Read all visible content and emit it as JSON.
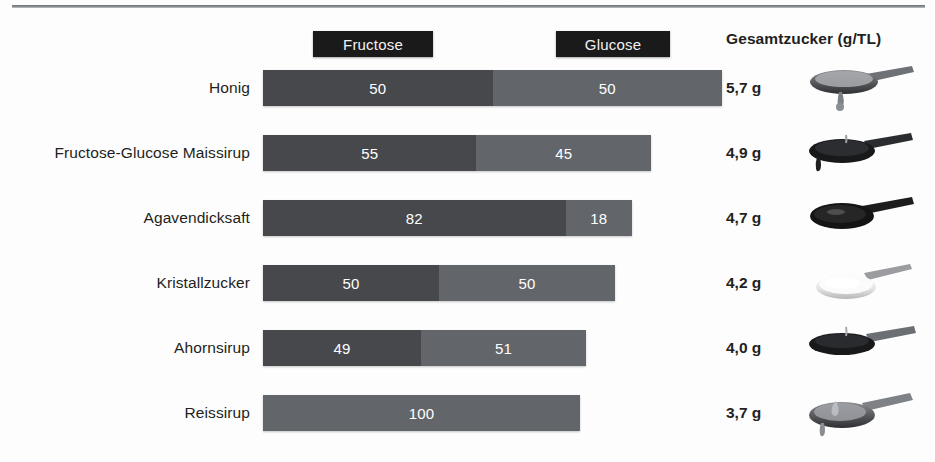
{
  "legend": {
    "fructose_label": "Fructose",
    "glucose_label": "Glucose"
  },
  "columns": {
    "total_sugar_header": "Gesamtzucker (g/TL)"
  },
  "colors": {
    "fructose": "#46484c",
    "glucose": "#626569",
    "legend_chip": "#1a1a1a",
    "text": "#231f20",
    "background": "#fdfdfd"
  },
  "rows": [
    {
      "label": "Honig",
      "fructose": "50",
      "glucose": "50",
      "total": "5,7 g",
      "image": "spoon-dripping-honey"
    },
    {
      "label": "Fructose-Glucose Maissirup",
      "fructose": "55",
      "glucose": "45",
      "total": "4,9 g",
      "image": "spoon-dark-corn-syrup"
    },
    {
      "label": "Agavendicksaft",
      "fructose": "82",
      "glucose": "18",
      "total": "4,7 g",
      "image": "spoon-dark-agave-syrup"
    },
    {
      "label": "Kristallzucker",
      "fructose": "50",
      "glucose": "50",
      "total": "4,2 g",
      "image": "spoon-white-crystal-sugar"
    },
    {
      "label": "Ahornsirup",
      "fructose": "49",
      "glucose": "51",
      "total": "4,0 g",
      "image": "spoon-maple-syrup"
    },
    {
      "label": "Reissirup",
      "fructose": "",
      "glucose": "100",
      "total": "3,7 g",
      "image": "spoon-rice-syrup"
    }
  ],
  "chart_data": {
    "type": "bar",
    "title": "",
    "subtype": "horizontal-stacked-100-percent",
    "categories": [
      "Honig",
      "Fructose-Glucose Maissirup",
      "Agavendicksaft",
      "Kristallzucker",
      "Ahornsirup",
      "Reissirup"
    ],
    "series": [
      {
        "name": "Fructose",
        "values": [
          50,
          55,
          82,
          50,
          49,
          0
        ],
        "color": "#46484c"
      },
      {
        "name": "Glucose",
        "values": [
          50,
          45,
          18,
          50,
          51,
          100
        ],
        "color": "#626569"
      }
    ],
    "annotations": {
      "Gesamtzucker (g/TL)": [
        "5,7 g",
        "4,9 g",
        "4,7 g",
        "4,2 g",
        "4,0 g",
        "3,7 g"
      ]
    },
    "bar_pixel_widths": [
      459,
      388,
      369,
      352,
      323,
      317
    ],
    "xlabel": "",
    "ylabel": "",
    "xlim": [
      0,
      100
    ],
    "grid": false,
    "legend_position": "top",
    "units": "percent of sugar content; Gesamtzucker in grams per teaspoon (g/TL)"
  }
}
